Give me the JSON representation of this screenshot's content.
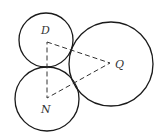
{
  "diagram": {
    "type": "tangent-circles",
    "background": "#ffffff",
    "stroke_color": "#1a1a1a",
    "circles": [
      {
        "name": "D",
        "cx": 46,
        "cy": 40,
        "r": 27
      },
      {
        "name": "N",
        "cx": 47,
        "cy": 99,
        "r": 32
      },
      {
        "name": "Q",
        "cx": 111,
        "cy": 64,
        "r": 42
      }
    ],
    "triangle": {
      "style": "dashed",
      "vertices": [
        {
          "name": "D",
          "x": 47,
          "y": 42
        },
        {
          "name": "Q",
          "x": 110,
          "y": 63
        },
        {
          "name": "N",
          "x": 47,
          "y": 98
        }
      ]
    },
    "labels": [
      {
        "text": "D",
        "x": 41,
        "y": 34
      },
      {
        "text": "Q",
        "x": 115,
        "y": 68
      },
      {
        "text": "N",
        "x": 41,
        "y": 113
      }
    ]
  }
}
